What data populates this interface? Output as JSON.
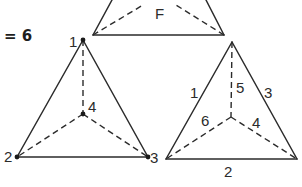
{
  "equation": {
    "text": "= 6"
  },
  "top_figure": {
    "face_label": "F"
  },
  "left_tetrahedron": {
    "vertex_labels": {
      "top": "1",
      "center": "4",
      "bottom_left": "2",
      "bottom_right": "3"
    }
  },
  "right_tetrahedron": {
    "edge_labels": {
      "left": "1",
      "vertical": "5",
      "right": "3",
      "center_left": "6",
      "center_right": "4",
      "bottom": "2"
    }
  },
  "colors": {
    "stroke": "#2b2b2b",
    "background": "#ffffff"
  }
}
